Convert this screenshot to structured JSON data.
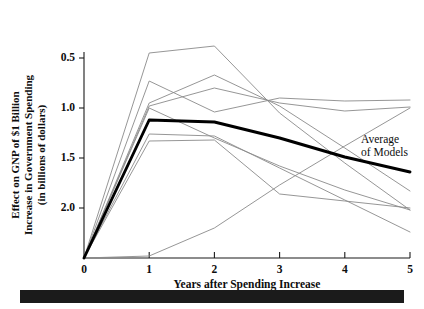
{
  "figure": {
    "background_color": "#ffffff",
    "accent_color": "#000000",
    "model_line_color": "#8a8a8a",
    "bottom_bar_color": "#1b1b1b"
  },
  "axes": {
    "y_title_line1": "Effect on GNP of $1 Billion",
    "y_title_line2": "Increase in Government Spending",
    "y_title_line3": "(in billions of dollars)",
    "x_title": "Years after Spending Increase",
    "y_ticks": [
      "2.0",
      "1.5",
      "1.0",
      "0.5"
    ],
    "x_ticks": [
      "0",
      "1",
      "2",
      "3",
      "4",
      "5"
    ]
  },
  "annotations": {
    "average_label_line1": "Average",
    "average_label_line2": "of Models"
  },
  "chart_data": {
    "type": "line",
    "title": "",
    "subtitle": "",
    "xlabel": "Years after Spending Increase",
    "ylabel": "Effect on GNP of $1 Billion Increase in Government Spending (in billions of dollars)",
    "x": [
      0,
      1,
      2,
      3,
      4,
      5
    ],
    "xlim": [
      0,
      5
    ],
    "ylim": [
      0,
      2.2
    ],
    "xticks": [
      0,
      1,
      2,
      3,
      4,
      5
    ],
    "yticks": [
      0.5,
      1.0,
      1.5,
      2.0
    ],
    "grid": false,
    "legend": "none",
    "annotation_text": "Average of Models",
    "series": [
      {
        "name": "Model 1",
        "emphasis": "normal",
        "values": [
          0.0,
          2.05,
          2.12,
          1.45,
          0.95,
          0.48
        ]
      },
      {
        "name": "Model 2",
        "emphasis": "normal",
        "values": [
          0.0,
          1.77,
          1.46,
          1.6,
          1.57,
          1.58
        ]
      },
      {
        "name": "Model 3",
        "emphasis": "normal",
        "values": [
          0.0,
          1.55,
          1.83,
          1.52,
          1.1,
          0.67
        ]
      },
      {
        "name": "Model 4",
        "emphasis": "normal",
        "values": [
          0.0,
          1.52,
          1.7,
          1.55,
          1.47,
          1.51
        ]
      },
      {
        "name": "Model 5",
        "emphasis": "normal",
        "values": [
          0.0,
          1.5,
          1.2,
          0.92,
          0.68,
          0.48
        ]
      },
      {
        "name": "Model 6",
        "emphasis": "normal",
        "values": [
          0.0,
          1.24,
          1.22,
          0.9,
          0.58,
          0.26
        ]
      },
      {
        "name": "Model 7",
        "emphasis": "normal",
        "values": [
          0.0,
          1.17,
          1.18,
          0.64,
          0.57,
          0.5
        ]
      },
      {
        "name": "Model 8",
        "emphasis": "normal",
        "values": [
          0.0,
          0.02,
          0.3,
          0.73,
          1.12,
          1.5
        ]
      },
      {
        "name": "Average of Models",
        "emphasis": "bold",
        "values": [
          0.0,
          1.38,
          1.36,
          1.2,
          1.01,
          0.86
        ]
      }
    ]
  }
}
